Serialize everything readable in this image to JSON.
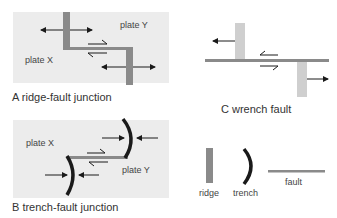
{
  "colors": {
    "panel_bg": "#ececec",
    "ridge_dark": "#8a8a8a",
    "ridge_light": "#cfcfcf",
    "fault": "#8a8a8a",
    "trench": "#1a1a1a",
    "arrow": "#1a1a1a"
  },
  "panels": {
    "A": {
      "title": "A ridge-fault junction",
      "plate_x": "plate X",
      "plate_y": "plate Y"
    },
    "B": {
      "title": "B trench-fault junction",
      "plate_x": "plate X",
      "plate_y": "plate Y"
    },
    "C": {
      "title": "C wrench fault"
    }
  },
  "legend": {
    "ridge": "ridge",
    "trench": "trench",
    "fault": "fault"
  }
}
